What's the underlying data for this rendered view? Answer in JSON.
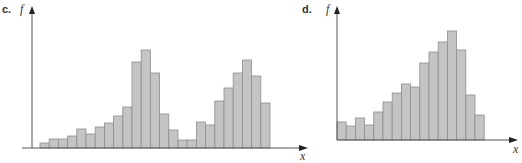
{
  "chart_data": [
    {
      "type": "bar",
      "panel_label": "c.",
      "title": "",
      "xlabel": "x",
      "ylabel": "f",
      "grid": false,
      "legend": null,
      "description": "Bimodal histogram with a tall left peak and a smaller right peak",
      "categories": [
        "1",
        "2",
        "3",
        "4",
        "5",
        "6",
        "7",
        "8",
        "9",
        "10",
        "11",
        "12",
        "13",
        "14",
        "15",
        "16",
        "17",
        "18",
        "19",
        "20",
        "21",
        "22",
        "23",
        "24",
        "25"
      ],
      "values": [
        5,
        9,
        9,
        12,
        19,
        14,
        21,
        25,
        32,
        41,
        86,
        98,
        75,
        34,
        18,
        8,
        8,
        26,
        23,
        47,
        60,
        75,
        88,
        72,
        45
      ],
      "ylim": [
        0,
        136
      ]
    },
    {
      "type": "bar",
      "panel_label": "d.",
      "title": "",
      "xlabel": "x",
      "ylabel": "f",
      "grid": false,
      "legend": null,
      "description": "Left-skewed unimodal histogram peaking near the right end",
      "categories": [
        "1",
        "2",
        "3",
        "4",
        "5",
        "6",
        "7",
        "8",
        "9",
        "10",
        "11",
        "12",
        "13",
        "14",
        "15",
        "16"
      ],
      "values": [
        18,
        14,
        22,
        15,
        28,
        38,
        47,
        56,
        53,
        77,
        88,
        98,
        109,
        90,
        45,
        25
      ],
      "ylim": [
        0,
        128
      ]
    }
  ],
  "panels": {
    "c": {
      "label": "c.",
      "ylabel": "f",
      "xlabel": "x"
    },
    "d": {
      "label": "d.",
      "ylabel": "f",
      "xlabel": "x"
    }
  },
  "colors": {
    "bar_fill": "#c4c4c4",
    "bar_stroke": "#8e8e8e",
    "axis": "#555555"
  }
}
